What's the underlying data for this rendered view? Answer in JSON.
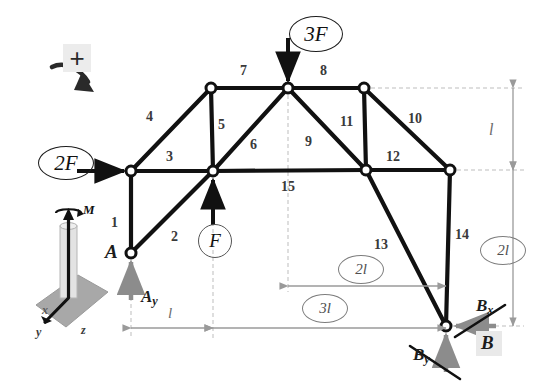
{
  "diagram": {
    "sign_convention_symbol": "+",
    "loads": [
      {
        "id": "load-2F",
        "label": "2F",
        "direction": "right",
        "at": "node-N1"
      },
      {
        "id": "load-3F",
        "label": "3F",
        "direction": "down",
        "at": "node-apex"
      },
      {
        "id": "load-F",
        "label": "F",
        "direction": "up",
        "at": "node-N3"
      }
    ],
    "supports": [
      {
        "id": "support-A",
        "label": "A",
        "reaction_label": "A",
        "reaction_sub": "y",
        "direction": "up"
      },
      {
        "id": "support-B",
        "label": "B",
        "reactions": [
          {
            "label": "B",
            "sub": "x",
            "direction": "left"
          },
          {
            "label": "B",
            "sub": "y",
            "direction": "up"
          }
        ]
      }
    ],
    "members": [
      {
        "num": "1"
      },
      {
        "num": "2"
      },
      {
        "num": "3"
      },
      {
        "num": "4"
      },
      {
        "num": "5"
      },
      {
        "num": "6"
      },
      {
        "num": "7"
      },
      {
        "num": "8"
      },
      {
        "num": "9"
      },
      {
        "num": "10"
      },
      {
        "num": "11"
      },
      {
        "num": "12"
      },
      {
        "num": "13"
      },
      {
        "num": "14"
      },
      {
        "num": "15"
      }
    ],
    "dimensions": [
      {
        "id": "dim-h-l",
        "label": "l",
        "orientation": "horizontal",
        "circled": false
      },
      {
        "id": "dim-h-3l",
        "label": "3l",
        "orientation": "horizontal",
        "circled": true
      },
      {
        "id": "dim-h-2l",
        "label": "2l",
        "orientation": "horizontal",
        "circled": true
      },
      {
        "id": "dim-v-l",
        "label": "l",
        "orientation": "vertical",
        "circled": false
      },
      {
        "id": "dim-v-2l",
        "label": "2l",
        "orientation": "vertical",
        "circled": true
      }
    ],
    "moment_icon": {
      "label": "M",
      "axis_labels": [
        "x",
        "y",
        "z"
      ]
    },
    "colors": {
      "member": "#111111",
      "load_arrow": "#111111",
      "reaction_arrow": "#8c8c8c",
      "dimension": "#9a9a9a",
      "guide": "#b8b8b8",
      "text": "#2b2b2b"
    }
  }
}
